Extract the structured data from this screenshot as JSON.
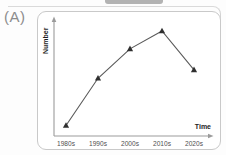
{
  "figure_label": "(A)",
  "colors": {
    "line": "#5a5a5a",
    "marker": "#2f2f2f",
    "axis": "#9b9b9b",
    "tick_label": "#4f4f4f",
    "axis_title": "#1e1e1e",
    "panel_border": "#c9c9c9",
    "figure_label_grey": "#8c8c8c",
    "remnant_grey": "#b3b3b3"
  },
  "chart_data": {
    "type": "line",
    "title": "",
    "xlabel": "Time",
    "ylabel": "Number",
    "categories": [
      "1980s",
      "1990s",
      "2000s",
      "2010s",
      "2020s"
    ],
    "values": [
      10,
      55,
      83,
      100,
      63
    ],
    "ylim": [
      0,
      110
    ],
    "value_scale": "relative (axis is unlabeled / qualitative)",
    "marker_shape": "filled triangle",
    "legend": "none",
    "grid": "off",
    "axes_style": "arrow-ended, no tick marks"
  }
}
